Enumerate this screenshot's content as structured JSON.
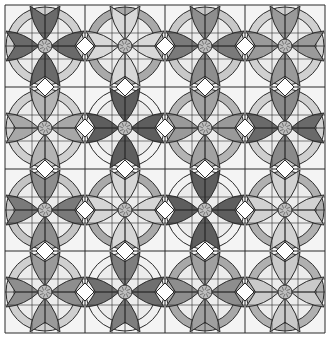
{
  "grid": {
    "rows": 4,
    "cols": 4,
    "origin_x": 5,
    "origin_y": 5,
    "block_w": 80,
    "block_h": 82
  },
  "colors": {
    "background": "#f4f4f4",
    "line": "#2a2a2a",
    "inner_circle": "#ececec",
    "diamond": "#ffffff",
    "medallion": "#bdbdbd"
  },
  "blocks": [
    {
      "row": 0,
      "col": 0,
      "petal_v": "#6a6a6a",
      "petal_h": "#6a6a6a",
      "ring": "#cfcfcf"
    },
    {
      "row": 0,
      "col": 1,
      "petal_v": "#d8d8d8",
      "petal_h": "#d8d8d8",
      "ring": "#a9a9a9"
    },
    {
      "row": 0,
      "col": 2,
      "petal_v": "#8e8e8e",
      "petal_h": "#7a7a7a",
      "ring": "#c8c8c8"
    },
    {
      "row": 0,
      "col": 3,
      "petal_v": "#9a9a9a",
      "petal_h": "#9a9a9a",
      "ring": "#d0d0d0"
    },
    {
      "row": 1,
      "col": 0,
      "petal_v": "#b4b4b4",
      "petal_h": "#a8a8a8",
      "ring": "#cfcfcf"
    },
    {
      "row": 1,
      "col": 1,
      "petal_v": "#5e5e5e",
      "petal_h": "#5e5e5e",
      "ring": "#f2f2f2"
    },
    {
      "row": 1,
      "col": 2,
      "petal_v": "#a2a2a2",
      "petal_h": "#9a9a9a",
      "ring": "#b4b4b4"
    },
    {
      "row": 1,
      "col": 3,
      "petal_v": "#8a8a8a",
      "petal_h": "#6a6a6a",
      "ring": "#cfcfcf"
    },
    {
      "row": 2,
      "col": 0,
      "petal_v": "#8e8e8e",
      "petal_h": "#7a7a7a",
      "ring": "#c4c4c4"
    },
    {
      "row": 2,
      "col": 1,
      "petal_v": "#d6d6d6",
      "petal_h": "#d6d6d6",
      "ring": "#a9a9a9"
    },
    {
      "row": 2,
      "col": 2,
      "petal_v": "#5e5e5e",
      "petal_h": "#5e5e5e",
      "ring": "#f2f2f2"
    },
    {
      "row": 2,
      "col": 3,
      "petal_v": "#d2d2d2",
      "petal_h": "#d2d2d2",
      "ring": "#b0b0b0"
    },
    {
      "row": 3,
      "col": 0,
      "petal_v": "#9a9a9a",
      "petal_h": "#8e8e8e",
      "ring": "#cfcfcf"
    },
    {
      "row": 3,
      "col": 1,
      "petal_v": "#7e7e7e",
      "petal_h": "#707070",
      "ring": "#f0f0f0"
    },
    {
      "row": 3,
      "col": 2,
      "petal_v": "#a0a0a0",
      "petal_h": "#8e8e8e",
      "ring": "#a8a8a8"
    },
    {
      "row": 3,
      "col": 3,
      "petal_v": "#cacaca",
      "petal_h": "#cacaca",
      "ring": "#b0b0b0"
    }
  ]
}
